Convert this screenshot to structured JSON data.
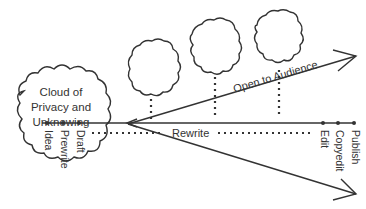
{
  "diagram": {
    "cloud_label_lines": [
      "Cloud of",
      "Privacy and",
      "Unknowing"
    ],
    "stages_private": [
      "Idea",
      "Prewrite",
      "Draft"
    ],
    "rewrite_label": "Rewrite",
    "stages_public": [
      "Edit",
      "Copyedit",
      "Publish"
    ],
    "audience_label": "Open to Audience",
    "audience_clouds": 3,
    "colors": {
      "line": "#333333",
      "background": "#ffffff"
    }
  }
}
